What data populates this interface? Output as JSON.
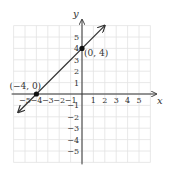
{
  "chart_data": {
    "type": "line",
    "title": "",
    "xlabel": "x",
    "ylabel": "y",
    "xlim": [
      -6,
      6
    ],
    "ylim": [
      -6,
      6
    ],
    "grid": true,
    "x_ticks": [
      -5,
      -4,
      -3,
      -2,
      -1,
      1,
      2,
      3,
      4,
      5
    ],
    "y_ticks": [
      -5,
      -4,
      -3,
      -2,
      -1,
      1,
      2,
      3,
      4,
      5
    ],
    "x_tick_labels": [
      "−5",
      "−4",
      "−3",
      "−2",
      "−1",
      "1",
      "2",
      "3",
      "4",
      "5"
    ],
    "y_tick_labels": [
      "−5",
      "−4",
      "−3",
      "−2",
      "−1",
      "1",
      "2",
      "3",
      "4",
      "5"
    ],
    "series": [
      {
        "name": "y = x + 4",
        "x": [
          -5.6,
          2.0
        ],
        "y": [
          -1.6,
          6.0
        ],
        "arrows": "both"
      }
    ],
    "points": [
      {
        "x": -4,
        "y": 0,
        "label": "(−4, 0)"
      },
      {
        "x": 0,
        "y": 4,
        "label": "(0, 4)"
      }
    ]
  },
  "colors": {
    "grid": "#e2e2e2",
    "axis": "#333333",
    "line": "#333333",
    "point": "#111111"
  }
}
